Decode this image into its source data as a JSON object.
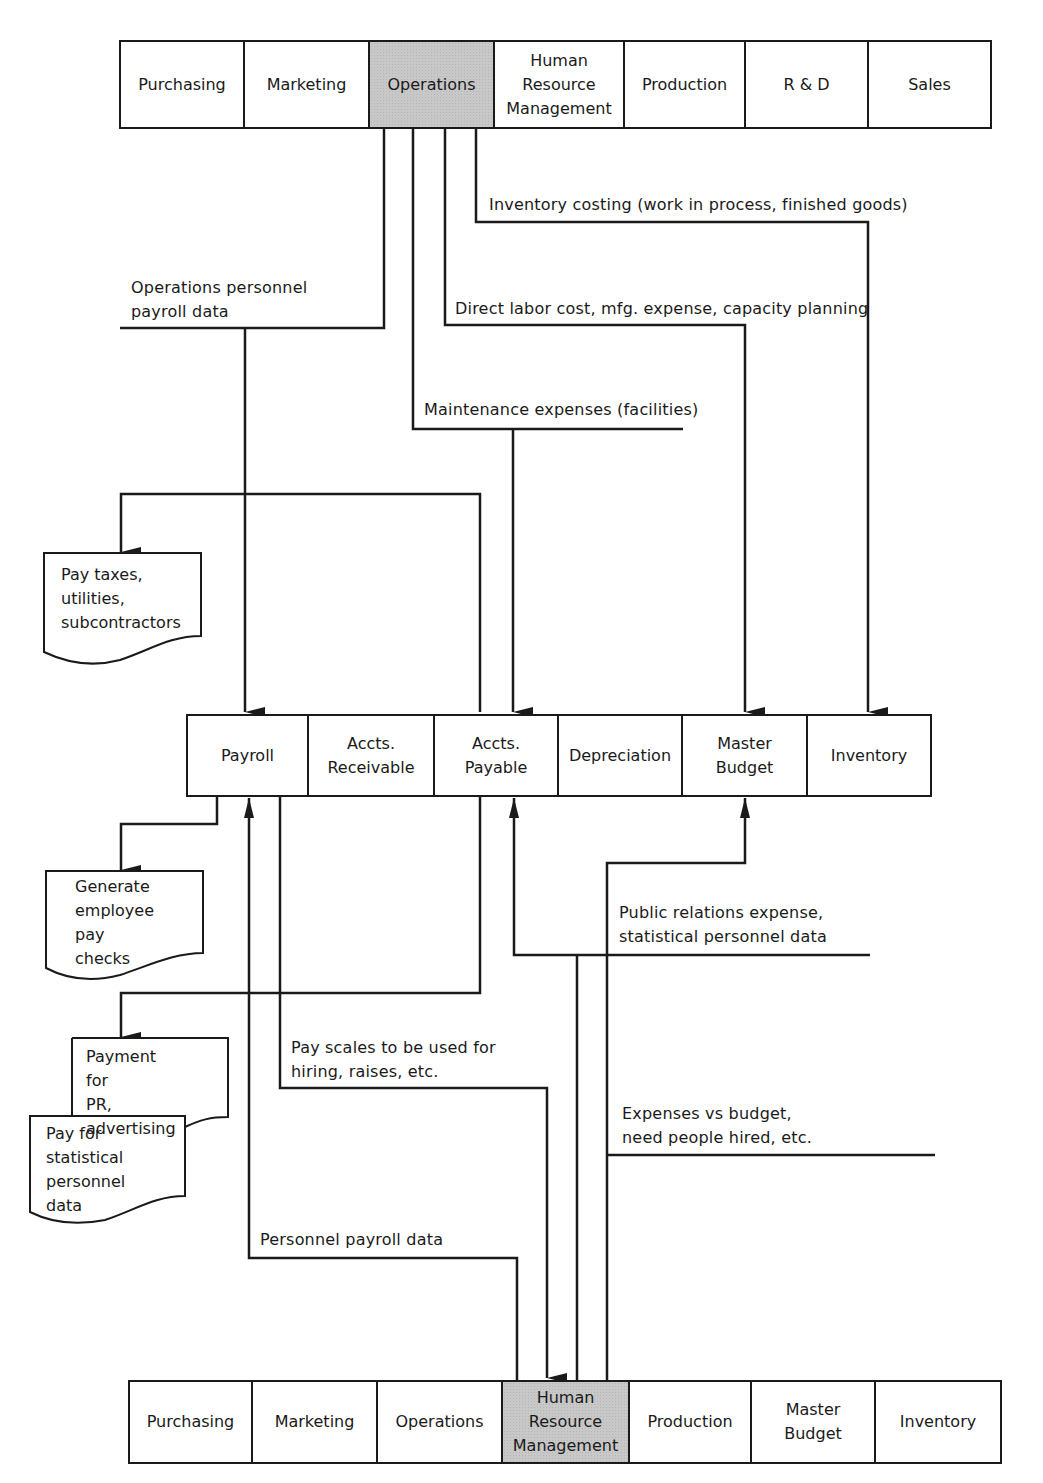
{
  "top_row": {
    "highlighted": "Operations",
    "cells": [
      {
        "label": "Purchasing"
      },
      {
        "label": "Marketing"
      },
      {
        "label": "Operations"
      },
      {
        "label": "Human\nResource\nManagement"
      },
      {
        "label": "Production"
      },
      {
        "label": "R & D"
      },
      {
        "label": "Sales"
      }
    ]
  },
  "middle_row": {
    "cells": [
      {
        "label": "Payroll"
      },
      {
        "label": "Accts.\nReceivable"
      },
      {
        "label": "Accts.\nPayable"
      },
      {
        "label": "Depreciation"
      },
      {
        "label": "Master\nBudget"
      },
      {
        "label": "Inventory"
      }
    ]
  },
  "bottom_row": {
    "highlighted": "Human Resource Management",
    "cells": [
      {
        "label": "Purchasing"
      },
      {
        "label": "Marketing"
      },
      {
        "label": "Operations"
      },
      {
        "label": "Human\nResource\nManagement"
      },
      {
        "label": "Production"
      },
      {
        "label": "Master\nBudget"
      },
      {
        "label": "Inventory"
      }
    ]
  },
  "flow_labels": {
    "inventory_costing": "Inventory costing (work in process, finished goods)",
    "ops_personnel_payroll": "Operations personnel\npayroll data",
    "direct_labor": "Direct labor cost, mfg. expense, capacity planning",
    "maintenance": "Maintenance expenses (facilities)",
    "public_relations": "Public relations expense,\nstatistical personnel data",
    "pay_scales": "Pay scales to be used for\nhiring, raises, etc.",
    "expenses_vs_budget": "Expenses vs budget,\nneed people hired, etc.",
    "personnel_payroll": "Personnel payroll data"
  },
  "documents": {
    "pay_taxes": "Pay taxes,\nutilities,\nsubcontractors",
    "generate_checks": "Generate\nemployee\npay checks",
    "payment_pr": "Payment for\nPR, advertising",
    "pay_statistical": "Pay for\nstatistical\npersonnel data"
  },
  "colors": {
    "line": "#1a1a1a",
    "highlight": "#c8c8c8"
  }
}
